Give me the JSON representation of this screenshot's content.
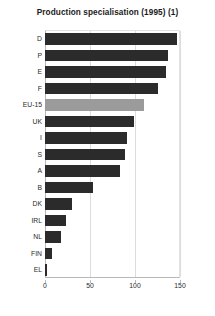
{
  "chart_data": {
    "type": "bar",
    "orientation": "horizontal",
    "title": "Production specialisation (1995) (1)",
    "xlabel": "",
    "ylabel": "",
    "categories": [
      "D",
      "P",
      "E",
      "F",
      "EU-15",
      "UK",
      "I",
      "S",
      "A",
      "B",
      "DK",
      "IRL",
      "NL",
      "FIN",
      "EL"
    ],
    "values": [
      147,
      137,
      134,
      126,
      110,
      99,
      91,
      89,
      83,
      53,
      30,
      23,
      18,
      8,
      2
    ],
    "highlight_category": "EU-15",
    "xlim": [
      0,
      150
    ],
    "xticks": [
      0,
      50,
      100,
      150
    ],
    "xtick_labels": [
      "0",
      "50",
      "100",
      "150"
    ],
    "grid": "vertical",
    "legend": "none",
    "bar_color": "#2b2b2b",
    "highlight_color": "#9b9b9b",
    "grid_color": "#dcdcdc",
    "axis_color": "#b8b8b8",
    "background_color": "#ffffff"
  }
}
